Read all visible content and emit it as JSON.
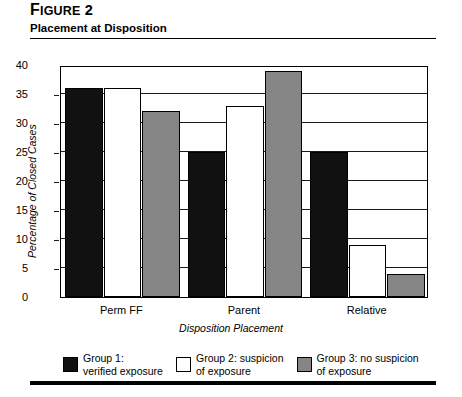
{
  "figure": {
    "number_lead": "F",
    "number_rest": "IGURE",
    "number_value": "2",
    "title": "Placement at Disposition"
  },
  "chart_data": {
    "type": "bar",
    "title": "Placement at Disposition",
    "xlabel": "Disposition Placement",
    "ylabel": "Percentage of Closed Cases",
    "categories": [
      "Perm FF",
      "Parent",
      "Relative"
    ],
    "series": [
      {
        "name": "Group 1: verified exposure",
        "short": "Group 1:",
        "line2": "verified exposure",
        "color": "#111111",
        "values": [
          36,
          25,
          25
        ]
      },
      {
        "name": "Group 2: suspicion of exposure",
        "short": "Group 2: suspicion",
        "line2": "of exposure",
        "color": "#ffffff",
        "values": [
          36,
          33,
          9
        ]
      },
      {
        "name": "Group 3: no suspicion of exposure",
        "short": "Group 3: no suspicion",
        "line2": "of exposure",
        "color": "#858585",
        "values": [
          32,
          39,
          4
        ]
      }
    ],
    "ylim": [
      0,
      40
    ],
    "yticks": [
      0,
      5,
      10,
      15,
      20,
      25,
      30,
      35,
      40
    ],
    "ytick_labels": [
      "0",
      "5",
      "10",
      "15",
      "20",
      "25",
      "30",
      "35",
      "40"
    ],
    "grid": true,
    "legend_position": "bottom"
  }
}
